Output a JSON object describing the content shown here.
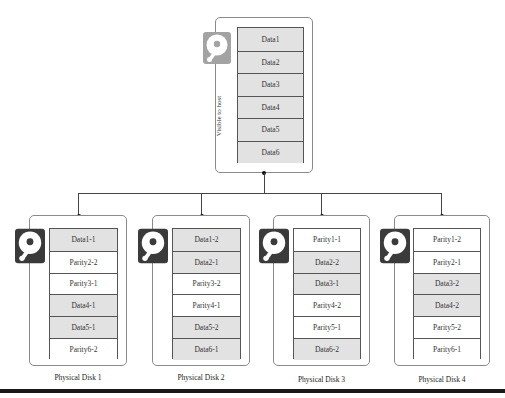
{
  "host": {
    "label": "Visible to host",
    "icon": "hard-disk-icon",
    "icon_color": "#a0a0a0",
    "cells": [
      {
        "text": "Data1",
        "type": "data"
      },
      {
        "text": "Data2",
        "type": "data"
      },
      {
        "text": "Data3",
        "type": "data"
      },
      {
        "text": "Data4",
        "type": "data"
      },
      {
        "text": "Data5",
        "type": "data"
      },
      {
        "text": "Data6",
        "type": "data"
      }
    ]
  },
  "disks": [
    {
      "label": "Physical Disk 1",
      "icon": "hard-disk-icon",
      "cells": [
        {
          "text": "Data1-1",
          "type": "data"
        },
        {
          "text": "Parity2-2",
          "type": "parity"
        },
        {
          "text": "Parity3-1",
          "type": "parity"
        },
        {
          "text": "Data4-1",
          "type": "data"
        },
        {
          "text": "Data5-1",
          "type": "data"
        },
        {
          "text": "Parity6-2",
          "type": "parity"
        }
      ]
    },
    {
      "label": "Physical Disk 2",
      "icon": "hard-disk-icon",
      "cells": [
        {
          "text": "Data1-2",
          "type": "data"
        },
        {
          "text": "Data2-1",
          "type": "data"
        },
        {
          "text": "Parity3-2",
          "type": "parity"
        },
        {
          "text": "Parity4-1",
          "type": "parity"
        },
        {
          "text": "Data5-2",
          "type": "data"
        },
        {
          "text": "Data6-1",
          "type": "data"
        }
      ]
    },
    {
      "label": "Physical Disk 3",
      "icon": "hard-disk-icon",
      "cells": [
        {
          "text": "Parity1-1",
          "type": "parity"
        },
        {
          "text": "Data2-2",
          "type": "data"
        },
        {
          "text": "Data3-1",
          "type": "data"
        },
        {
          "text": "Parity4-2",
          "type": "parity"
        },
        {
          "text": "Parity5-1",
          "type": "parity"
        },
        {
          "text": "Data6-2",
          "type": "data"
        }
      ]
    },
    {
      "label": "Physical Disk 4",
      "icon": "hard-disk-icon",
      "cells": [
        {
          "text": "Parity1-2",
          "type": "parity"
        },
        {
          "text": "Parity2-1",
          "type": "parity"
        },
        {
          "text": "Data3-2",
          "type": "data"
        },
        {
          "text": "Data4-2",
          "type": "data"
        },
        {
          "text": "Parity5-2",
          "type": "parity"
        },
        {
          "text": "Parity6-1",
          "type": "parity"
        }
      ]
    }
  ],
  "colors": {
    "data_fill": "#e2e2e2",
    "parity_fill": "#ffffff",
    "disk_icon_dark": "#3a3a3a",
    "host_icon": "#a0a0a0"
  }
}
